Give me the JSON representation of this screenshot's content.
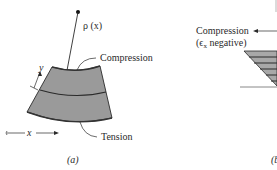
{
  "figure": {
    "panel_a": {
      "rho_label": "ρ (x)",
      "compression_label": "Compression",
      "tension_label": "Tension",
      "y_axis_label": "y",
      "x_axis_label": "x",
      "caption": "(a)"
    },
    "panel_b": {
      "compression_label": "Compression",
      "compression_sub_label": "(ϵx negative)",
      "compression_sub_prefix": "(ϵ",
      "compression_sub_subscript": "x",
      "compression_sub_suffix": " negative)",
      "caption": "(b"
    },
    "colors": {
      "beam_fill": "#9a9a9a",
      "line": "#2a2a2a",
      "hatch_fill": "#a8a8a8"
    }
  }
}
